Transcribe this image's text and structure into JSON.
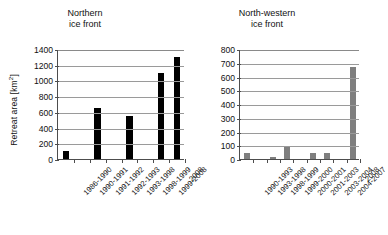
{
  "figure": {
    "ylabel_text": "Retreat area [km",
    "ylabel_sup": "2",
    "ylabel_tail": "]"
  },
  "chart_data": [
    {
      "type": "bar",
      "title": "Northern\nice front",
      "title_line1": "Northern",
      "title_line2": "ice front",
      "xlabel": "",
      "ylabel": "Retreat area [km2]",
      "ylim": [
        0,
        1400
      ],
      "ytick_step": 200,
      "yticks": [
        0,
        200,
        400,
        600,
        800,
        1000,
        1200,
        1400
      ],
      "grid": true,
      "legend": "none",
      "bar_color": "#000000",
      "categories": [
        "1986-1990",
        "1990-1991",
        "1991-1992",
        "1992-1993",
        "1993-1998",
        "1998-1999",
        "1999-2008",
        "2008"
      ],
      "values": [
        100,
        0,
        650,
        0,
        550,
        0,
        1090,
        1295
      ]
    },
    {
      "type": "bar",
      "title": "North-western\nice front",
      "title_line1": "North-western",
      "title_line2": "ice front",
      "xlabel": "",
      "ylabel": "Retreat area [km2]",
      "ylim": [
        0,
        800
      ],
      "ytick_step": 100,
      "yticks": [
        0,
        100,
        200,
        300,
        400,
        500,
        600,
        700,
        800
      ],
      "grid": true,
      "legend": "none",
      "bar_color": "#7f7f7f",
      "categories": [
        "1990-1993",
        "1993-1998",
        "1998-1999",
        "1999-2000",
        "2000-2001",
        "2001-2003",
        "2003-2004",
        "2004-2007",
        "2008"
      ],
      "values": [
        45,
        0,
        18,
        90,
        0,
        42,
        42,
        0,
        670
      ]
    }
  ]
}
